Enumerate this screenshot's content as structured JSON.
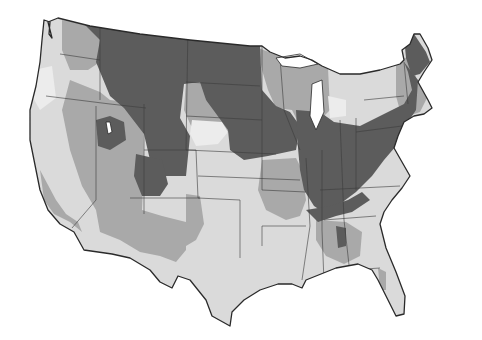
{
  "map": {
    "subject": "Contiguous United States choropleth (grayscale, county-level shading)",
    "title": "",
    "legend": [],
    "colors": {
      "background": "#ffffff",
      "base_light": "#dadada",
      "lightest": "#ececec",
      "medium": "#a9a9a9",
      "dark": "#5c5c5c",
      "border": "#3c3c3c",
      "outline": "#2a2a2a"
    },
    "shading_levels": [
      "lightest",
      "light",
      "medium",
      "dark"
    ],
    "regions_dark": [
      "Montana",
      "Wyoming",
      "North Dakota",
      "South Dakota",
      "Nebraska",
      "Kansas",
      "Iowa",
      "Illinois",
      "Indiana",
      "Ohio",
      "Pennsylvania",
      "New York",
      "Maine",
      "Idaho (panhandle)",
      "Colorado (west)",
      "Appalachia"
    ],
    "regions_medium": [
      "Oregon (east)",
      "Nevada",
      "Utah",
      "Arizona",
      "New Mexico",
      "Minnesota (north)",
      "Wisconsin",
      "Missouri",
      "Washington (east)"
    ],
    "regions_light": [
      "California",
      "Texas",
      "Oklahoma",
      "Louisiana",
      "Mississippi",
      "Georgia",
      "Florida",
      "South Carolina",
      "North Carolina"
    ]
  }
}
